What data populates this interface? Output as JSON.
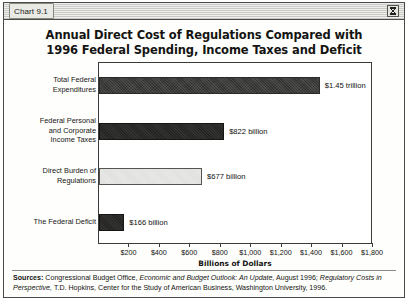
{
  "window": {
    "title": "Chart 9.1",
    "zoom_box_icon": "hourglass-icon"
  },
  "chart_title": {
    "line1": "Annual Direct Cost of Regulations Compared with",
    "line2": "1996 Federal Spending, Income Taxes and Deficit"
  },
  "sources": {
    "label": "Sources:",
    "part1": " Congressional Budget Office, ",
    "italic1": "Economic and Budget Outlook: An Update,",
    "part2": " August 1996; ",
    "italic2": "Regulatory Costs in Perspective,",
    "part3": " T.D. Hopkins, Center for the Study of American Business, Washington University, 1996."
  },
  "chart_data": {
    "type": "bar",
    "orientation": "horizontal",
    "title": "Annual Direct Cost of Regulations Compared with 1996 Federal Spending, Income Taxes and Deficit",
    "xlabel": "Billions of Dollars",
    "ylabel": "",
    "xlim": [
      0,
      1800
    ],
    "grid": false,
    "legend": "none",
    "xticks": [
      200,
      400,
      600,
      800,
      1000,
      1200,
      1400,
      1600,
      1800
    ],
    "xticklabels": [
      "$200",
      "$400",
      "$600",
      "$800",
      "$1,000",
      "$1,200",
      "$1,400",
      "$1,600",
      "$1,800"
    ],
    "categories": [
      "Total Federal Expenditures",
      "Federal Personal and Corporate Income Taxes",
      "Direct Burden of Regulations",
      "The Federal Deficit"
    ],
    "category_lines": [
      [
        "Total Federal",
        "Expenditures"
      ],
      [
        "Federal Personal",
        "and Corporate",
        "Income Taxes"
      ],
      [
        "Direct Burden of",
        "Regulations"
      ],
      [
        "The Federal Deficit"
      ]
    ],
    "values": [
      1450,
      822,
      677,
      166
    ],
    "data_labels": [
      "$1.45 trillion",
      "$822 billion",
      "$677 billion",
      "$166 billion"
    ],
    "bar_styles": [
      "dark",
      "darker",
      "light",
      "darker"
    ],
    "colors": {
      "dark": "#3a3a38",
      "darker": "#242422",
      "light": "#e8e8e6",
      "axis": "#3b3b39",
      "plot_background": "#ffffff"
    }
  }
}
